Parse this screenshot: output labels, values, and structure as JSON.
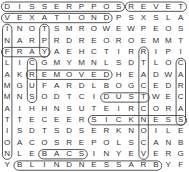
{
  "puzzle": {
    "type": "word-search",
    "rows": 15,
    "cols": 15,
    "grid": [
      "DISSERPPOSREVET",
      "VEXATIONDPSXSLA",
      "INOTSMROWEWPEOS",
      "NARPRDREOROEMMT",
      "FRAYAEHCTIRRIPI",
      "LICGMYMNLSDTLOC",
      "AKREMOVEDHEADWA",
      "MGUFARDLBOGCEDR",
      "MNSODTCIDUSTWEC",
      "AIHHNSUTEIRCORA",
      "TTECEERSICKNESS",
      "ISDTSDSERKNOILE",
      "OACOSREPOLSCANB",
      "NLEBACSINYEVERG",
      "YBLINDNESSARBYF"
    ],
    "highlights": [
      {
        "dir": "h",
        "r": 0,
        "c1": 0,
        "c2": 9
      },
      {
        "dir": "h",
        "r": 0,
        "c1": 10,
        "c2": 14
      },
      {
        "dir": "h",
        "r": 1,
        "c1": 0,
        "c2": 8
      },
      {
        "dir": "h",
        "r": 6,
        "c1": 2,
        "c2": 8
      },
      {
        "dir": "h",
        "r": 8,
        "c1": 8,
        "c2": 11
      },
      {
        "dir": "h",
        "r": 10,
        "c1": 7,
        "c2": 14
      },
      {
        "dir": "h",
        "r": 13,
        "c1": 3,
        "c2": 6
      },
      {
        "dir": "h",
        "r": 14,
        "c1": 1,
        "c2": 12
      },
      {
        "dir": "h",
        "r": 4,
        "c1": 0,
        "c2": 3
      },
      {
        "dir": "v",
        "c": 0,
        "r1": 2,
        "r2": 13
      },
      {
        "dir": "v",
        "c": 2,
        "r1": 5,
        "r2": 8
      },
      {
        "dir": "v",
        "c": 3,
        "r1": 2,
        "r2": 4
      },
      {
        "dir": "v",
        "c": 14,
        "r1": 5,
        "r2": 10
      },
      {
        "dir": "v",
        "c": 11,
        "r1": 4,
        "r2": 13
      }
    ]
  }
}
